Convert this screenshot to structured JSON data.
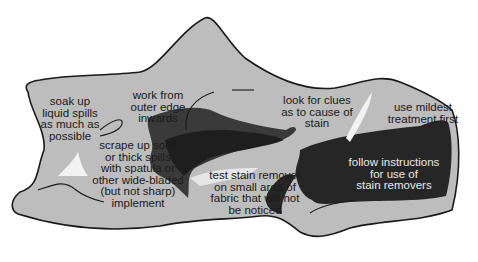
{
  "diagram": {
    "title": "",
    "colors": {
      "background": "#ffffff",
      "fabric": "#bdbdbd",
      "outline": "#1a1a1a",
      "stain_dark": "#2a2a2a",
      "stain_mid": "#4a4a4a",
      "highlight": "#f2f2f2",
      "text": "#1a1a1a",
      "text_light": "#e8e8e8"
    },
    "labels": [
      {
        "id": "soak",
        "text": "soak up\nliquid spills\nas much as\npossible"
      },
      {
        "id": "work",
        "text": "work from\nouter edge\ninwards"
      },
      {
        "id": "clues",
        "text": "look for clues\nas to cause of\nstain"
      },
      {
        "id": "mildest",
        "text": "use mildest\ntreatment first"
      },
      {
        "id": "scrape",
        "text": "scrape up solid\nor thick spills\nwith spatula or\nother wide-bladed\n(but not sharp)\nimplement"
      },
      {
        "id": "test",
        "text": "test stain remover\non small area of\nfabric that will not\nbe noticed"
      },
      {
        "id": "follow",
        "text": "follow instructions\nfor use of\nstain removers"
      }
    ]
  }
}
